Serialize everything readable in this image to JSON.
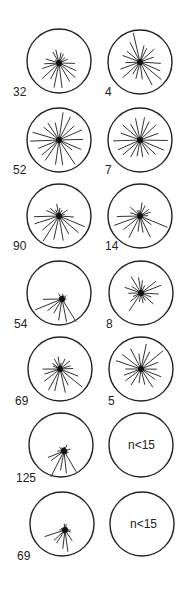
{
  "figure": {
    "type": "circular rose diagrams (vector orientations)",
    "columns": 2,
    "rows": 7,
    "line_color": "#222222",
    "background": "#ffffff"
  },
  "chart_data": {
    "type": "rose",
    "title": "",
    "panels": [
      {
        "row": 0,
        "col": 0,
        "n_label": "32",
        "empty": false,
        "spread": "skewed-up-right"
      },
      {
        "row": 0,
        "col": 1,
        "n_label": "4",
        "empty": false,
        "spread": "uniform"
      },
      {
        "row": 1,
        "col": 0,
        "n_label": "52",
        "empty": false,
        "spread": "uniform"
      },
      {
        "row": 1,
        "col": 1,
        "n_label": "7",
        "empty": false,
        "spread": "uniform"
      },
      {
        "row": 2,
        "col": 0,
        "n_label": "90",
        "empty": false,
        "spread": "upper-heavy"
      },
      {
        "row": 2,
        "col": 1,
        "n_label": "14",
        "empty": false,
        "spread": "upper-heavy"
      },
      {
        "row": 3,
        "col": 0,
        "n_label": "54",
        "empty": false,
        "spread": "upper-left"
      },
      {
        "row": 3,
        "col": 1,
        "n_label": "8",
        "empty": false,
        "spread": "uniform-short"
      },
      {
        "row": 4,
        "col": 0,
        "n_label": "69",
        "empty": false,
        "spread": "upper-heavy"
      },
      {
        "row": 4,
        "col": 1,
        "n_label": "5",
        "empty": false,
        "spread": "uniform"
      },
      {
        "row": 5,
        "col": 0,
        "n_label": "125",
        "empty": false,
        "spread": "upper-left"
      },
      {
        "row": 5,
        "col": 1,
        "n_label": "",
        "empty": true,
        "text": "n<15"
      },
      {
        "row": 6,
        "col": 0,
        "n_label": "69",
        "empty": false,
        "spread": "upper-left"
      },
      {
        "row": 6,
        "col": 1,
        "n_label": "",
        "empty": true,
        "text": "n<15"
      }
    ]
  },
  "labels": {
    "r0c0": "32",
    "r0c1": "4",
    "r1c0": "52",
    "r1c1": "7",
    "r2c0": "90",
    "r2c1": "14",
    "r3c0": "54",
    "r3c1": "8",
    "r4c0": "69",
    "r4c1": "5",
    "r5c0": "125",
    "r5c1": "n<15",
    "r6c0": "69",
    "r6c1": "n<15"
  }
}
